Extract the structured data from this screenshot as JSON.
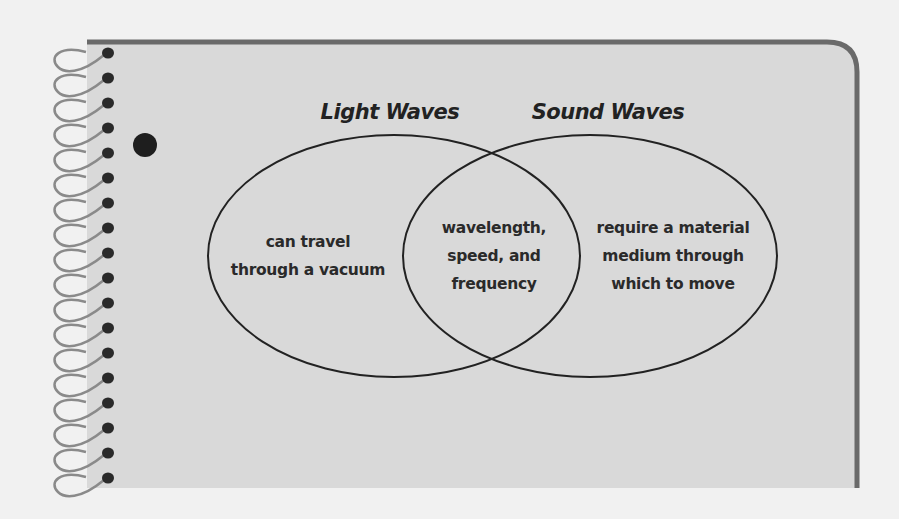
{
  "diagram": {
    "type": "venn",
    "colors": {
      "background": "#f1f1f1",
      "card": "#d9d9d9",
      "border": "#6a6a6a",
      "ink": "#222222"
    },
    "sets": [
      {
        "title": "Light Waves",
        "unique": [
          "can travel",
          "through a vacuum"
        ]
      },
      {
        "title": "Sound Waves",
        "unique": [
          "require a material",
          "medium through",
          "which to move"
        ]
      }
    ],
    "overlap": [
      "wavelength,",
      "speed, and",
      "frequency"
    ]
  }
}
